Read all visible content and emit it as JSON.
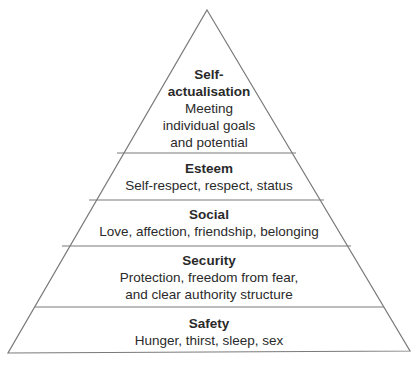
{
  "diagram": {
    "type": "pyramid",
    "colors": {
      "line": "#7a7a7a",
      "text": "#2a2a2a",
      "background": "#ffffff"
    },
    "levels": [
      {
        "title": "Self-actualisation",
        "title_lines": [
          "Self-",
          "actualisation"
        ],
        "description_lines": [
          "Meeting",
          "individual goals",
          "and potential"
        ]
      },
      {
        "title": "Esteem",
        "description_lines": [
          "Self-respect, respect, status"
        ]
      },
      {
        "title": "Social",
        "description_lines": [
          "Love, affection, friendship, belonging"
        ]
      },
      {
        "title": "Security",
        "description_lines": [
          "Protection, freedom from fear,",
          "and clear authority structure"
        ]
      },
      {
        "title": "Safety",
        "description_lines": [
          "Hunger, thirst, sleep, sex"
        ]
      }
    ]
  }
}
